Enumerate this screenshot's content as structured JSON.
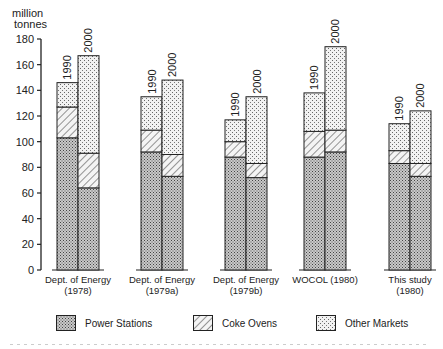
{
  "chart_data": {
    "type": "bar",
    "stacked": true,
    "title": "",
    "ylabel": "million tonnes",
    "xlabel": "",
    "ylim": [
      0,
      180
    ],
    "yticks": [
      0,
      20,
      40,
      60,
      80,
      100,
      120,
      140,
      160,
      180
    ],
    "grid": false,
    "legend_position": "bottom",
    "groups": [
      "Dept. of Energy (1978)",
      "Dept. of Energy (1979a)",
      "Dept. of Energy (1979b)",
      "WOCOL (1980)",
      "This study (1980)"
    ],
    "group_labels": [
      [
        "Dept. of Energy",
        "(1978)"
      ],
      [
        "Dept. of Energy",
        "(1979a)"
      ],
      [
        "Dept. of Energy",
        "(1979b)"
      ],
      [
        "WOCOL (1980)",
        ""
      ],
      [
        "This study",
        "(1980)"
      ]
    ],
    "bar_labels": [
      "1990",
      "2000"
    ],
    "series": [
      {
        "name": "Power Stations",
        "pattern": "dense-dots",
        "values": [
          [
            103,
            64
          ],
          [
            92,
            73
          ],
          [
            88,
            72
          ],
          [
            88,
            92
          ],
          [
            83,
            73
          ]
        ]
      },
      {
        "name": "Coke Ovens",
        "pattern": "hatch",
        "values": [
          [
            24,
            27
          ],
          [
            17,
            17
          ],
          [
            12,
            11
          ],
          [
            20,
            17
          ],
          [
            10,
            10
          ]
        ]
      },
      {
        "name": "Other Markets",
        "pattern": "sparse-dots",
        "values": [
          [
            19,
            76
          ],
          [
            26,
            58
          ],
          [
            17,
            52
          ],
          [
            30,
            65
          ],
          [
            21,
            41
          ]
        ]
      }
    ],
    "totals": [
      [
        146,
        167
      ],
      [
        135,
        148
      ],
      [
        117,
        135
      ],
      [
        138,
        174
      ],
      [
        114,
        124
      ]
    ]
  },
  "legend": {
    "items": [
      {
        "label": "Power Stations"
      },
      {
        "label": "Coke Ovens"
      },
      {
        "label": "Other Markets"
      }
    ]
  },
  "axis": {
    "unit_line1": "million",
    "unit_line2": "tonnes"
  }
}
